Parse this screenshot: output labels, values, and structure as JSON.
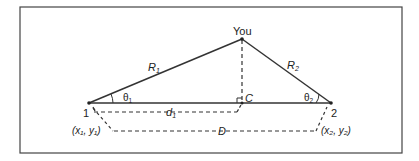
{
  "diagram": {
    "labels": {
      "you": "You",
      "r1": "R",
      "r1_sub": "1",
      "r2": "R",
      "r2_sub": "2",
      "theta1": "θ",
      "theta1_sub": "1",
      "theta2": "θ",
      "theta2_sub": "2",
      "c": "C",
      "d1": "d",
      "d1_sub": "1",
      "d": "D",
      "point1": "1",
      "point2": "2",
      "coord1": "(x₁, y₁)",
      "coord2": "(x₂, y₂)"
    },
    "colors": {
      "line": "#333333",
      "frame": "#444444",
      "background": "#ffffff"
    }
  }
}
